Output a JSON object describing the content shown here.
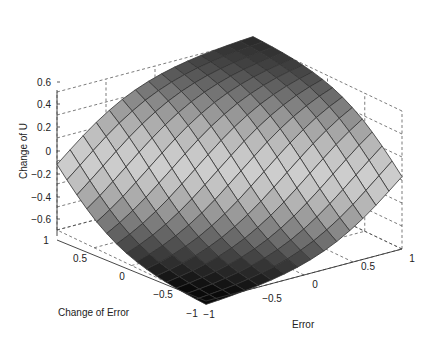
{
  "chart_data": {
    "type": "surface",
    "title": "",
    "xlabel": "Error",
    "ylabel": "Change of Error",
    "zlabel": "Change of U",
    "xlim": [
      -1,
      1
    ],
    "ylim": [
      -1,
      1
    ],
    "zlim": [
      -0.6,
      0.6
    ],
    "xticks": [
      "-1",
      "-0.5",
      "0",
      "0.5",
      "1"
    ],
    "yticks": [
      "-1",
      "-0.5",
      "0",
      "0.5",
      "1"
    ],
    "zticks": [
      "-0.6",
      "-0.4",
      "-0.2",
      "0",
      "0.2",
      "0.4",
      "0.6"
    ],
    "grid": true,
    "colormap": "gray",
    "grid_size": 16,
    "corner_values": {
      "E-1_CE-1": -0.6,
      "E-1_CE1": 0.0,
      "E1_CE-1": 0.05,
      "E1_CE1": 0.62,
      "E0_CE0": 0.0
    }
  },
  "labels": {
    "zlabel": "Change of U",
    "xlabel": "Error",
    "ylabel": "Change of Error"
  }
}
